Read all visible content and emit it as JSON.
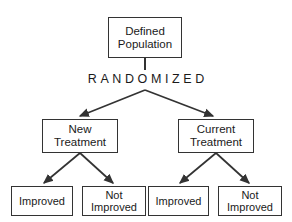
{
  "diagram": {
    "background_color": "#ffffff",
    "line_color": "#333333",
    "text_color": "#1a1a1a",
    "randomization_label": "RANDOMIZED",
    "nodes": {
      "population": "Defined\nPopulation",
      "new_treatment": "New\nTreatment",
      "current_treatment": "Current\nTreatment",
      "new_improved": "Improved",
      "new_not_improved": "Not\nImproved",
      "current_improved": "Improved",
      "current_not_improved": "Not\nImproved"
    }
  }
}
